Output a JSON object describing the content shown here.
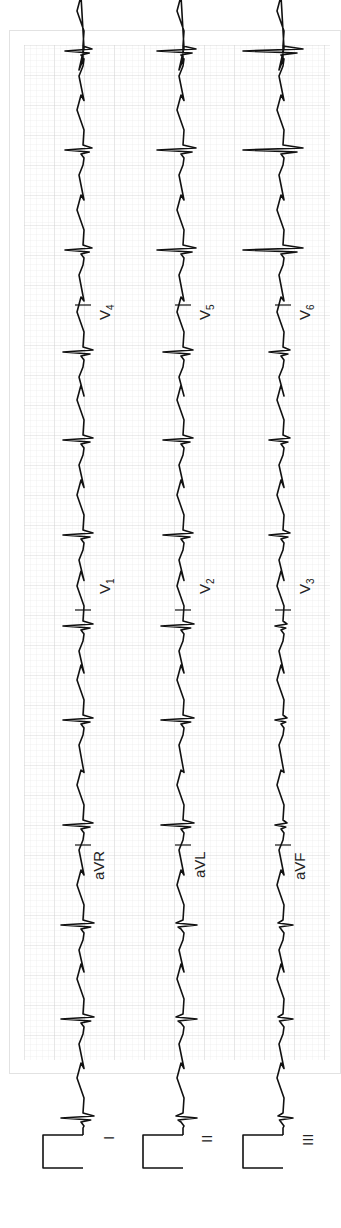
{
  "document": {
    "type": "12-lead electrocardiogram",
    "orientation": "rotated 90° counter-clockwise (time runs bottom to top)"
  },
  "colors": {
    "grid_minor": "#e4e4e4",
    "grid_major": "#c9c9c9",
    "trace": "#111111",
    "paper": "#ffffff"
  },
  "leads": {
    "row1": [
      "I",
      "aVR",
      "V1",
      "V4"
    ],
    "row2": [
      "II",
      "aVL",
      "V2",
      "V5"
    ],
    "row3": [
      "III",
      "aVF",
      "V3",
      "V6"
    ]
  },
  "labels": {
    "I": "I",
    "II": "II",
    "III": "III",
    "aVR": "aVR",
    "aVL": "aVL",
    "aVF": "aVF",
    "V1": "V",
    "V1_sub": "1",
    "V2": "V",
    "V2_sub": "2",
    "V3": "V",
    "V3_sub": "3",
    "V4": "V",
    "V4_sub": "4",
    "V5": "V",
    "V5_sub": "5",
    "V6": "V",
    "V6_sub": "6"
  },
  "chart_data": {
    "type": "line",
    "title": "",
    "xlabel": "",
    "ylabel": "",
    "grid": true,
    "layout": "3 rows x 4 columns, 12-lead ECG, calibration pulse at start of each row",
    "rows": [
      {
        "leads": [
          "I",
          "aVR",
          "V1",
          "V4"
        ],
        "qrs_morphology": [
          "upright R",
          "upright/RS",
          "rS",
          "deep S / rS"
        ]
      },
      {
        "leads": [
          "II",
          "aVL",
          "V2",
          "V5"
        ],
        "qrs_morphology": [
          "small r, S",
          "upright R",
          "rS",
          "RS"
        ]
      },
      {
        "leads": [
          "III",
          "aVF",
          "V3",
          "V6"
        ],
        "qrs_morphology": [
          "fragmented rSr",
          "small r",
          "rS",
          "tall R"
        ]
      }
    ],
    "beats_per_row": 12
  }
}
